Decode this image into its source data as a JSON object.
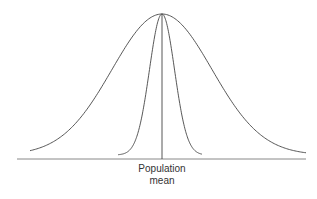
{
  "chart_data": {
    "type": "line",
    "title": "",
    "xlabel": "Population mean",
    "ylabel": "",
    "grid": false,
    "legend": null,
    "annotations": [
      "Population mean"
    ],
    "series": [
      {
        "name": "wide distribution",
        "description": "Broad normal curve (larger spread)",
        "mean": 0,
        "relative_sd": 1.0
      },
      {
        "name": "narrow distribution",
        "description": "Tall narrow normal curve (smaller spread), same peak height",
        "mean": 0,
        "relative_sd": 0.25
      }
    ],
    "reference_line": {
      "label": "Population mean",
      "x": 0
    }
  },
  "labels": {
    "line1": "Population",
    "line2": "mean"
  },
  "colors": {
    "curve": "#444444",
    "axis": "#888888"
  }
}
